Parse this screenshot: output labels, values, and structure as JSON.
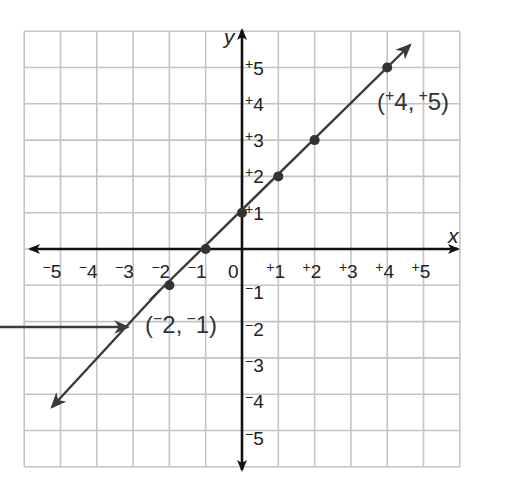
{
  "chart_data": {
    "type": "line",
    "title": "",
    "xlabel": "x",
    "ylabel": "y",
    "xlim": [
      -6,
      6
    ],
    "ylim": [
      -6,
      6
    ],
    "grid": true,
    "x_ticks": [
      "-5",
      "-4",
      "-3",
      "-2",
      "-1",
      "0",
      "+1",
      "+2",
      "+3",
      "+4",
      "+5"
    ],
    "y_ticks": [
      "+5",
      "+4",
      "+3",
      "+2",
      "+1",
      "-1",
      "-2",
      "-3",
      "-4",
      "-5"
    ],
    "series": [
      {
        "name": "y = x + 1",
        "x": [
          -2,
          -1,
          0,
          1,
          2,
          4
        ],
        "y": [
          -1,
          0,
          1,
          2,
          3,
          5
        ],
        "line_extends": [
          [
            -5.2,
            -4.2
          ],
          [
            4.6,
            5.6
          ]
        ],
        "arrows_both_ends": true
      }
    ],
    "annotations": [
      {
        "text": "(+4, +5)",
        "x": 4,
        "y": 5
      },
      {
        "text": "(-2, -1)",
        "x": -2,
        "y": -1
      },
      {
        "type": "pointer-arrow",
        "from": "left edge",
        "to": [
          -3,
          -2
        ]
      }
    ]
  },
  "labels": {
    "x_axis": "x",
    "y_axis": "y",
    "x_neg": [
      "5",
      "4",
      "3",
      "2",
      "1"
    ],
    "x_zero": "0",
    "x_pos": [
      "1",
      "2",
      "3",
      "4",
      "5"
    ],
    "y_pos": [
      "5",
      "4",
      "3",
      "2",
      "1"
    ],
    "y_neg": [
      "1",
      "2",
      "3",
      "4",
      "5"
    ],
    "minus_sign": "−",
    "plus_sign": "+",
    "point_a": {
      "open": "(",
      "sign1": "+",
      "x": "4",
      "comma": ",",
      "sign2": "+",
      "y": "5",
      "close": ")"
    },
    "point_b": {
      "open": "(",
      "sign1": "−",
      "x": "2",
      "comma": ",",
      "sign2": "−",
      "y": "1",
      "close": ")"
    }
  },
  "colors": {
    "grid": "#c4c4c4",
    "axis": "#111111",
    "line": "#3a3a3a",
    "point": "#333333",
    "text": "#222222"
  }
}
